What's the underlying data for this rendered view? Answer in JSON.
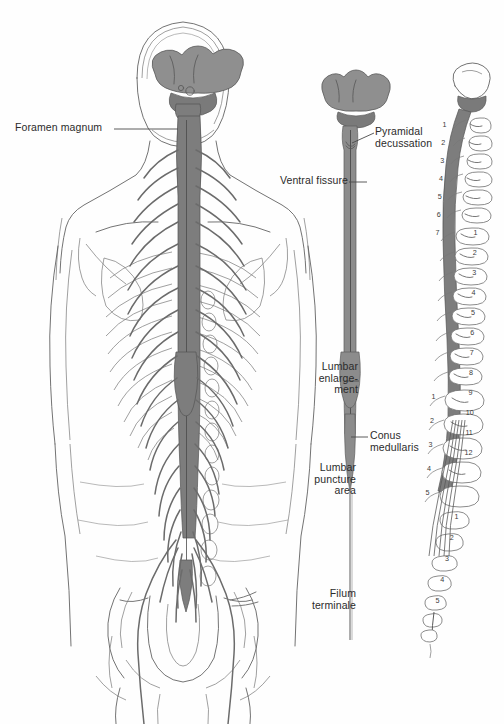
{
  "figure": {
    "background": "#ffffff",
    "ink": "#4a4a4a",
    "cord_fill": "#8a8a8a",
    "brain_fill": "#8f8f8f",
    "bone_stroke": "#6f6f6f"
  },
  "labels": {
    "foramen_magnum": "Foramen magnum",
    "ventral_fissure": "Ventral fissure",
    "pyramidal_decussation": "Pyramidal\ndecussation",
    "lumbar_enlargement": "Lumbar\nenlarge-\nment",
    "conus_medullaris": "Conus\nmedullaris",
    "lumbar_puncture_area": "Lumbar\npuncture\narea",
    "filum_terminale": "Filum\nterminale"
  },
  "vertebrae": {
    "cervical": [
      "1",
      "2",
      "3",
      "4",
      "5",
      "6",
      "7"
    ],
    "thoracic": [
      "1",
      "2",
      "3",
      "4",
      "5",
      "6",
      "7",
      "8",
      "9",
      "10",
      "11",
      "12"
    ],
    "lumbar": [
      "1",
      "2",
      "3",
      "4",
      "5"
    ],
    "sacral": [
      "1",
      "2",
      "3",
      "4",
      "5"
    ]
  },
  "caption": "",
  "panels": {
    "left": "whole-body posterior view with skull, ribs, pelvis and spinal cord",
    "middle": "isolated spinal cord with brainstem and cerebellum",
    "right": "lateral vertebral column with spinal cord and nerve roots"
  }
}
